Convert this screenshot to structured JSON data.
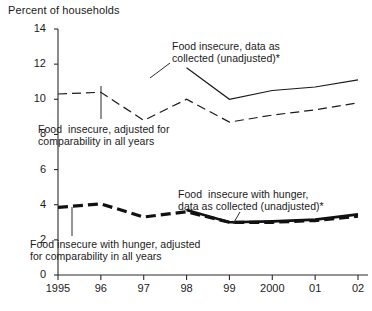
{
  "chart": {
    "y_axis_title": "Percent of households",
    "y_ticks": [
      "14",
      "12",
      "10",
      "8",
      "6",
      "4",
      "2",
      "0"
    ],
    "x_ticks": [
      "1995",
      "96",
      "97",
      "98",
      "99",
      "2000",
      "01",
      "02"
    ],
    "annotations": {
      "unadjusted_insecure": "Food insecure, data as\ncollected (unadjusted)*",
      "adjusted_insecure": "Food  insecure, adjusted for\ncomparability in all years",
      "unadjusted_hunger": "Food  insecure with hunger,\ndata as collected (unadjusted)*",
      "adjusted_hunger": "Food insecure with hunger, adjusted\nfor comparability in all years"
    }
  },
  "chart_data": {
    "type": "line",
    "title": "",
    "xlabel": "",
    "ylabel": "Percent of households",
    "xlim": [
      1995,
      2002
    ],
    "ylim": [
      0,
      14
    ],
    "ytick_step": 2,
    "grid": false,
    "legend": "annotations-on-plot",
    "x": [
      1995,
      1996,
      1997,
      1998,
      1999,
      2000,
      2001,
      2002
    ],
    "series": [
      {
        "name": "Food insecure, data as collected (unadjusted)*",
        "style": "solid",
        "color": "#1a1a1a",
        "width": 1.2,
        "x": [
          1998,
          1999,
          2000,
          2001,
          2002
        ],
        "values": [
          11.8,
          10.0,
          10.5,
          10.7,
          11.1
        ]
      },
      {
        "name": "Food  insecure, adjusted for comparability in all years",
        "style": "dashed",
        "color": "#1a1a1a",
        "width": 1.2,
        "x": [
          1995,
          1996,
          1997,
          1998,
          1999,
          2000,
          2001,
          2002
        ],
        "values": [
          10.3,
          10.4,
          8.8,
          10.0,
          8.7,
          9.1,
          9.4,
          9.8
        ]
      },
      {
        "name": "Food  insecure with hunger, data as collected (unadjusted)*",
        "style": "solid",
        "color": "#111111",
        "width": 2.6,
        "x": [
          1998,
          1999,
          2000,
          2001,
          2002
        ],
        "values": [
          3.7,
          3.0,
          3.05,
          3.15,
          3.45
        ]
      },
      {
        "name": "Food insecure with hunger, adjusted for comparability in all years",
        "style": "dashed-bold",
        "color": "#111111",
        "width": 3.2,
        "x": [
          1995,
          1996,
          1997,
          1998,
          1999,
          2000,
          2001,
          2002
        ],
        "values": [
          3.85,
          4.05,
          3.3,
          3.6,
          3.0,
          3.0,
          3.1,
          3.35
        ]
      }
    ],
    "leader_lines": [
      {
        "from_annotation": "unadjusted_insecure",
        "x1": 170,
        "y1": 63,
        "x2": 150,
        "y2": 78
      },
      {
        "from_annotation": "adjusted_insecure",
        "x1": 101,
        "y1": 119,
        "x2": 101,
        "y2": 86
      },
      {
        "from_annotation": "unadjusted_hunger",
        "x1": 240,
        "y1": 212,
        "x2": 233,
        "y2": 224
      },
      {
        "from_annotation": "adjusted_hunger",
        "x1": 72,
        "y1": 236,
        "x2": 72,
        "y2": 207
      }
    ]
  }
}
